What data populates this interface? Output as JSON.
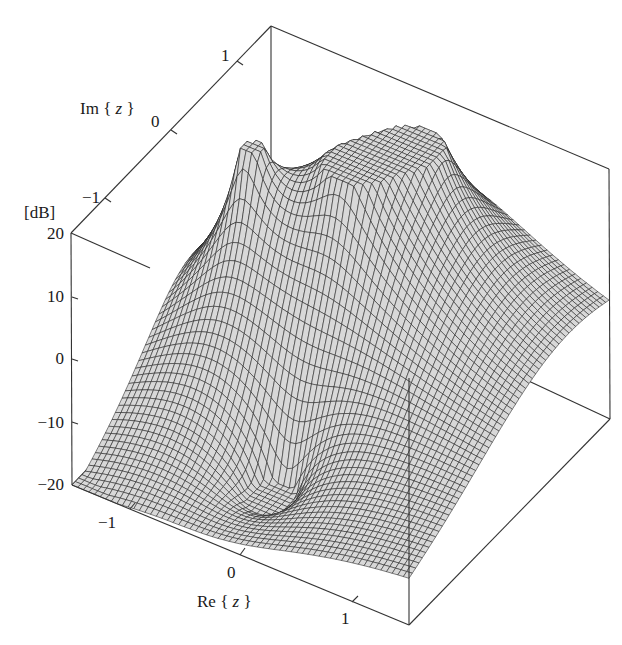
{
  "chart_data": {
    "type": "surface3d",
    "title": "",
    "zlabel": "[dB]",
    "xlabel_prefix": "Re",
    "xlabel_var": "z",
    "ylabel_prefix": "Im",
    "ylabel_var": "z",
    "xlim": [
      -1.5,
      1.5
    ],
    "ylim": [
      -1.5,
      1.5
    ],
    "zlim": [
      -20,
      20
    ],
    "x_ticks": [
      "-1",
      "0",
      "1"
    ],
    "y_ticks": [
      "-1",
      "0",
      "1"
    ],
    "z_ticks": [
      "-20",
      "-10",
      "0",
      "10",
      "20"
    ],
    "grid": false,
    "mesh_resolution": 60,
    "features": [
      {
        "kind": "pole",
        "label": "sharp spike",
        "re": -0.9,
        "im": 0.15,
        "approx_height_db": 20
      },
      {
        "kind": "pole",
        "label": "tall peak",
        "re": 0.15,
        "im": 0.9,
        "approx_height_db": 20
      },
      {
        "kind": "pole",
        "label": "center peak",
        "re": -0.1,
        "im": 0.35,
        "approx_height_db": 14
      },
      {
        "kind": "zero",
        "label": "dip",
        "re": -0.15,
        "im": -0.7,
        "approx_depth_db": -19
      }
    ],
    "surface_color": "#5a5a5a",
    "mesh_line_color": "#1e1e1e"
  },
  "labels": {
    "z_unit": "[dB]",
    "re_axis": "Re",
    "im_axis": "Im",
    "var": "z"
  }
}
